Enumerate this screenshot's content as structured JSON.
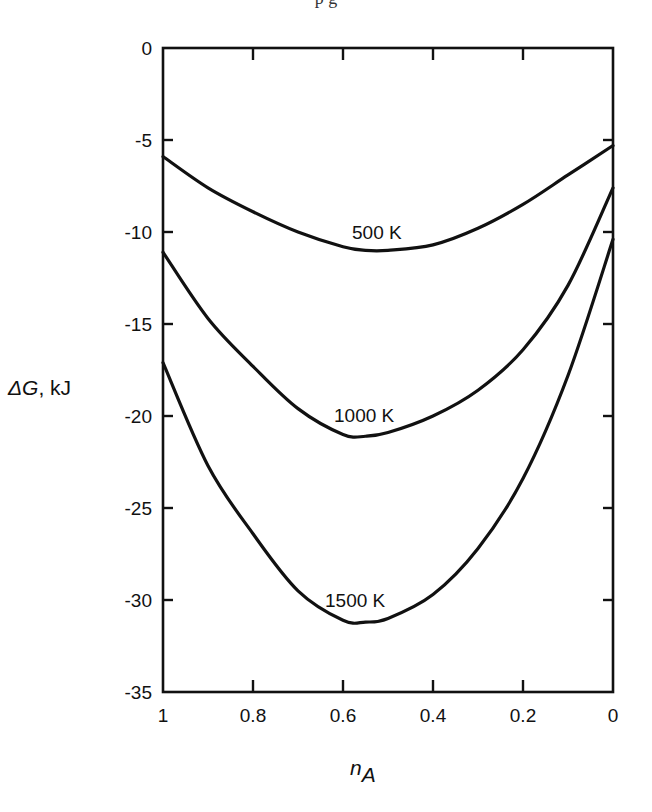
{
  "caption_fragment": "p                                         g",
  "chart_data": {
    "type": "line",
    "title": "",
    "xlabel": "n_A",
    "xlabel_main": "n",
    "xlabel_sub": "A",
    "ylabel": "ΔG, kJ",
    "ylabel_italic": "ΔG",
    "ylabel_unit": ", kJ",
    "xlim": [
      1,
      0
    ],
    "ylim": [
      -35,
      0
    ],
    "x_reversed": true,
    "xticks": [
      1,
      0.8,
      0.6,
      0.4,
      0.2,
      0
    ],
    "xtick_labels": [
      "1",
      "0.8",
      "0.6",
      "0.4",
      "0.2",
      "0"
    ],
    "yticks": [
      0,
      -5,
      -10,
      -15,
      -20,
      -25,
      -30,
      -35
    ],
    "ytick_labels": [
      "0",
      "-5",
      "-10",
      "-15",
      "-20",
      "-25",
      "-30",
      "-35"
    ],
    "grid": false,
    "legend": "inline labels on curves",
    "x": [
      1.0,
      0.9,
      0.8,
      0.7,
      0.6,
      0.55,
      0.5,
      0.4,
      0.3,
      0.2,
      0.1,
      0.0
    ],
    "series": [
      {
        "name": "500 K",
        "label": "500 K",
        "label_pos": [
          0.58,
          -10.4
        ],
        "values": [
          -5.9,
          -7.6,
          -8.9,
          -10.0,
          -10.8,
          -11.0,
          -11.0,
          -10.7,
          -9.8,
          -8.5,
          -6.9,
          -5.3
        ]
      },
      {
        "name": "1000 K",
        "label": "1000 K",
        "label_pos": [
          0.62,
          -20.3
        ],
        "values": [
          -11.1,
          -14.7,
          -17.3,
          -19.6,
          -21.0,
          -21.1,
          -20.9,
          -20.0,
          -18.6,
          -16.4,
          -12.9,
          -7.6
        ]
      },
      {
        "name": "1500 K",
        "label": "1500 K",
        "label_pos": [
          0.64,
          -30.4
        ],
        "values": [
          -17.1,
          -22.7,
          -26.4,
          -29.5,
          -31.1,
          -31.2,
          -31.0,
          -29.7,
          -27.2,
          -23.4,
          -17.8,
          -10.4
        ]
      }
    ]
  }
}
